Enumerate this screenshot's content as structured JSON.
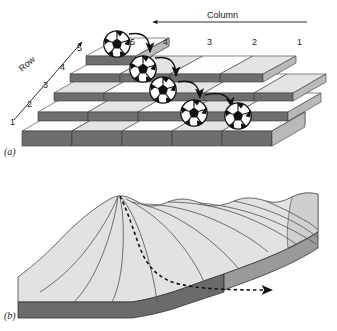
{
  "figure": {
    "type": "two-panel-schematic",
    "panels": [
      {
        "id": "a",
        "label": "(a)",
        "caption_label": "(a)",
        "kind": "discrete-raster-blocks",
        "axes": {
          "row": {
            "label": "Row",
            "direction": "up-right-diagonal-arrow",
            "ticks": [
              "1",
              "2",
              "3",
              "4",
              "5"
            ]
          },
          "column": {
            "label": "Column",
            "direction": "right-to-left-arrow",
            "ticks": [
              "5",
              "4",
              "3",
              "2",
              "1"
            ]
          }
        },
        "markers": {
          "name": "soccer-ball",
          "count": 5,
          "meaning": "flow path cells"
        },
        "arrows": {
          "count": 4,
          "style": "curved",
          "meaning": "steepest descent transitions"
        }
      },
      {
        "id": "b",
        "label": "(b)",
        "caption_label": "(b)",
        "kind": "continuous-terrain-surface",
        "features": [
          "contour-lines",
          "ridge-peak",
          "dashed-flow-path",
          "arrowhead"
        ]
      }
    ],
    "colors": {
      "background": "#ffffff",
      "block_top": "#fdfdfd",
      "block_top_shaded": "#e8e8e8",
      "block_side_dark": "#6e6e6e",
      "block_side_light": "#b9b9b9",
      "terrain_light": "#e2e2e2",
      "terrain_mid": "#d0d0d0",
      "terrain_base": "#6b6b6b",
      "ink": "#1a1a1a"
    }
  },
  "labels": {
    "row_axis": "Row",
    "column_axis": "Column",
    "row_ticks": [
      "1",
      "2",
      "3",
      "4",
      "5"
    ],
    "column_ticks": [
      "5",
      "4",
      "3",
      "2",
      "1"
    ],
    "panel_a": "(a)",
    "panel_b": "(b)"
  }
}
